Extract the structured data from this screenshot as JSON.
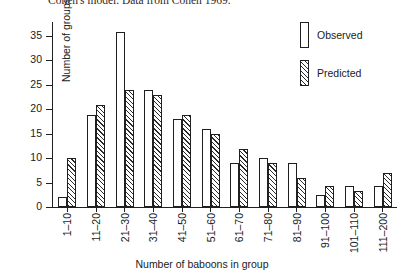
{
  "caption": "Cohen's model. Data from Cohen 1969.",
  "legend": {
    "position": "top-right",
    "entries": [
      {
        "label": "Observed",
        "style": "open"
      },
      {
        "label": "Predicted",
        "style": "hatched"
      }
    ]
  },
  "chart_data": {
    "type": "bar",
    "title": "",
    "xlabel": "Number of baboons in group",
    "ylabel": "Number of groups",
    "ylim": [
      0,
      38
    ],
    "yticks": [
      0,
      5,
      10,
      15,
      20,
      25,
      30,
      35
    ],
    "grid": false,
    "categories": [
      "1–10",
      "11–20",
      "21–30",
      "31–40",
      "41–50",
      "51–60",
      "61–70",
      "71–80",
      "81–90",
      "91–100",
      "101–110",
      "111–200"
    ],
    "series": [
      {
        "name": "Observed",
        "values": [
          2,
          19,
          36,
          24,
          18,
          16,
          9,
          10,
          9,
          2.5,
          4.3,
          4.3
        ]
      },
      {
        "name": "Predicted",
        "values": [
          10,
          21,
          24,
          23,
          19,
          15,
          12,
          9,
          6,
          4.3,
          3.3,
          7
        ]
      }
    ]
  }
}
